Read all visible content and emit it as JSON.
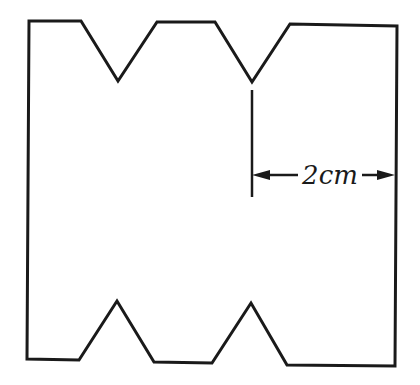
{
  "diagram": {
    "type": "cut-out-shape",
    "stroke_color": "#1a1a1a",
    "background": "#ffffff",
    "outline_points": [
      [
        29,
        21
      ],
      [
        81,
        21
      ],
      [
        118,
        81
      ],
      [
        157,
        22
      ],
      [
        215,
        22
      ],
      [
        252,
        82
      ],
      [
        290,
        24
      ],
      [
        397,
        26
      ],
      [
        395,
        366
      ],
      [
        287,
        365
      ],
      [
        251,
        303
      ],
      [
        212,
        363
      ],
      [
        154,
        362
      ],
      [
        117,
        301
      ],
      [
        79,
        360
      ],
      [
        27,
        359
      ]
    ],
    "dimension": {
      "label": "2cm",
      "extension_line": {
        "x": 252,
        "y1": 90,
        "y2": 197
      },
      "arrow": {
        "y": 175,
        "x_start": 252,
        "x_end": 395
      },
      "label_position": {
        "x": 330,
        "y": 184
      }
    }
  }
}
